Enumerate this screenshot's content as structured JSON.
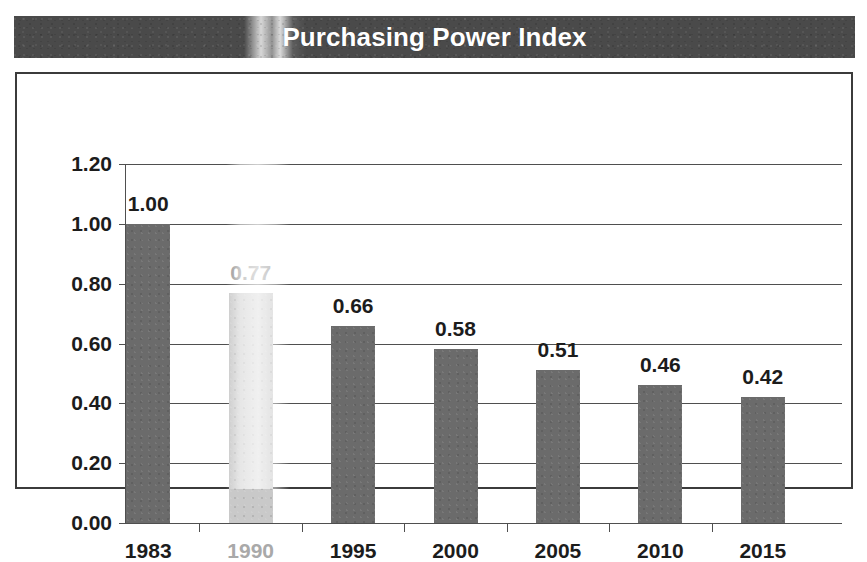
{
  "banner": {
    "title": "Purchasing Power Index",
    "background_color": "#4a4a4a",
    "text_color": "#ffffff"
  },
  "chart_data": {
    "type": "bar",
    "title": "Purchasing Power Index",
    "xlabel": "",
    "ylabel": "",
    "categories": [
      "1983",
      "1990",
      "1995",
      "2000",
      "2005",
      "2010",
      "2015"
    ],
    "values": [
      1.0,
      0.77,
      0.66,
      0.58,
      0.51,
      0.46,
      0.42
    ],
    "data_labels": [
      "1.00",
      "0.77",
      "0.66",
      "0.58",
      "0.51",
      "0.46",
      "0.42"
    ],
    "ylim": [
      0.0,
      1.2
    ],
    "y_ticks": [
      1.2,
      1.0,
      0.8,
      0.6,
      0.4,
      0.2,
      0.0
    ],
    "y_tick_labels": [
      "1.20",
      "1.00",
      "0.80",
      "0.60",
      "0.40",
      "0.20",
      "0.00"
    ],
    "grid": true,
    "legend": "none",
    "bar_color": "#6b6b6b",
    "faded_bar_color": "#c9c9c9",
    "faded_index": 1,
    "axis_color": "#4f4f4f",
    "label_color": "#1c1c1c"
  }
}
